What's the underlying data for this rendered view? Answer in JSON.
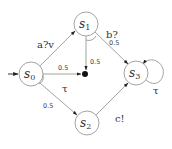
{
  "diagram": {
    "type": "probabilistic-automaton",
    "states": [
      {
        "id": "s0",
        "base": "s",
        "sub": "0",
        "initial": true
      },
      {
        "id": "s1",
        "base": "s",
        "sub": "1"
      },
      {
        "id": "s2",
        "base": "s",
        "sub": "2"
      },
      {
        "id": "s3",
        "base": "s",
        "sub": "3"
      }
    ],
    "edges": [
      {
        "from": "s0",
        "to": "s1",
        "label": "a?v"
      },
      {
        "from": "s0",
        "to": "dist",
        "label": "τ",
        "prob": "0.5"
      },
      {
        "from": "s0",
        "to": "s2",
        "label": "τ",
        "prob": "0.5"
      },
      {
        "from": "s1",
        "to": "dist",
        "label": "b?",
        "prob": "0.5"
      },
      {
        "from": "s1",
        "to": "s3",
        "label": "b?",
        "prob": "0.5"
      },
      {
        "from": "s2",
        "to": "s3",
        "label": "c!"
      },
      {
        "from": "s3",
        "to": "s3",
        "label": "τ"
      }
    ],
    "labels": {
      "a_v": "a?v",
      "b_q": "b?",
      "c_ex": "c!",
      "tau_s0": "τ",
      "tau_s3": "τ",
      "p_s0_dot": "0.5",
      "p_s0_s2": "0.5",
      "p_s1_dot": "0.5",
      "p_s1_s3": "0.5"
    }
  }
}
